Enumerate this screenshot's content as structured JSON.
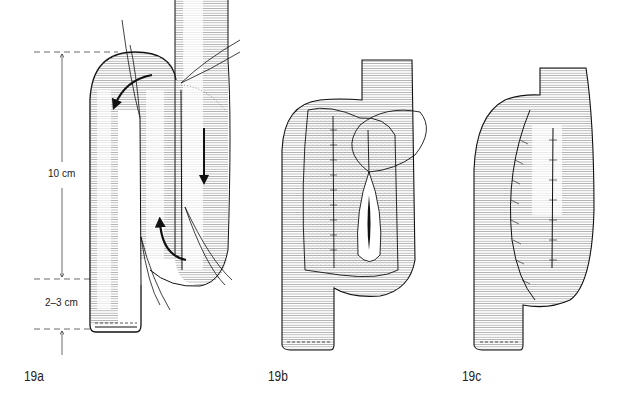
{
  "figure": {
    "panels": [
      {
        "id": "19a",
        "label": "19a"
      },
      {
        "id": "19b",
        "label": "19b"
      },
      {
        "id": "19c",
        "label": "19c"
      }
    ],
    "measurements": {
      "upper": "10 cm",
      "lower": "2–3 cm"
    },
    "colors": {
      "ink": "#111111",
      "hatch": "#555555",
      "background": "#ffffff",
      "dashed_guides": "#444444"
    }
  }
}
